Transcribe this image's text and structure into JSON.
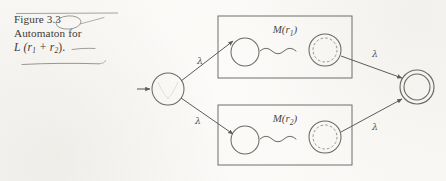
{
  "figure": {
    "caption": {
      "label": "Figure",
      "number": "3.3",
      "line2": "Automaton for",
      "formula_prefix": "L",
      "formula_body": "(r",
      "formula_sub1": "1",
      "formula_plus": " + r",
      "formula_sub2": "2",
      "formula_suffix": ")."
    },
    "annotations": {
      "top_rule": "horizontal-rule",
      "circled_number": "3.3",
      "underline_formula": "pencil-underline",
      "overline_r2": "pencil-overline"
    },
    "diagram": {
      "title": "Thompson construction NFA for union of two regular expressions",
      "start_state": {
        "name": "start-state",
        "shape": "circle",
        "cx": 168,
        "cy": 89,
        "r": 16
      },
      "start_arrow": {
        "name": "initial-arrow",
        "from_x": 137,
        "to_x": 151,
        "y": 89
      },
      "accept_state": {
        "name": "accepting-state",
        "shape": "double-circle",
        "cx": 417,
        "cy": 87,
        "r_outer": 17,
        "r_inner": 13
      },
      "boxes": [
        {
          "name": "machine-box-r1",
          "label": "M(r",
          "label_sub": "1",
          "label_close": ")",
          "x": 218,
          "y": 16,
          "width": 134,
          "height": 62,
          "label_x": 285,
          "label_y": 33,
          "sub_state": {
            "cx": 245,
            "cy": 52,
            "r": 14
          },
          "final_state": {
            "cx": 325,
            "cy": 50,
            "r_outer": 16,
            "r_inner": 12
          }
        },
        {
          "name": "machine-box-r2",
          "label": "M(r",
          "label_sub": "2",
          "label_close": ")",
          "x": 218,
          "y": 105,
          "width": 134,
          "height": 60,
          "label_x": 285,
          "label_y": 122,
          "sub_state": {
            "cx": 245,
            "cy": 140,
            "r": 14
          },
          "final_state": {
            "cx": 325,
            "cy": 137,
            "r_outer": 16,
            "r_inner": 12
          }
        }
      ],
      "edges": [
        {
          "name": "lambda-edge-start-to-r1",
          "label": "λ",
          "label_x": 197,
          "label_y": 63,
          "x1": 181,
          "y1": 80,
          "x2": 230,
          "y2": 40
        },
        {
          "name": "lambda-edge-start-to-r2",
          "label": "λ",
          "label_x": 197,
          "label_y": 122,
          "x1": 181,
          "y1": 99,
          "x2": 230,
          "y2": 133
        },
        {
          "name": "lambda-edge-r1-to-accept",
          "label": "λ",
          "label_x": 372,
          "label_y": 57,
          "x1": 340,
          "y1": 55,
          "x2": 403,
          "y2": 78
        },
        {
          "name": "lambda-edge-r2-to-accept",
          "label": "λ",
          "label_x": 372,
          "label_y": 128,
          "x1": 340,
          "y1": 133,
          "x2": 403,
          "y2": 98
        }
      ],
      "squiggles": [
        {
          "name": "squiggle-path-r1",
          "x1": 260,
          "x2": 308,
          "y": 51
        },
        {
          "name": "squiggle-path-r2",
          "x1": 260,
          "x2": 308,
          "y": 139
        }
      ]
    }
  }
}
